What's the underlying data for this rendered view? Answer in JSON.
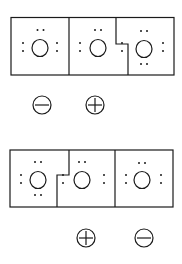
{
  "diagrams": [
    {
      "atoms": [
        {
          "symbol": "O",
          "lone_pairs": [
            "top",
            "left",
            "right"
          ]
        },
        {
          "symbol": "O",
          "lone_pairs": [
            "top",
            "left",
            "right"
          ]
        },
        {
          "symbol": "O",
          "lone_pairs": [
            "top",
            "left",
            "right",
            "bottom"
          ]
        }
      ],
      "charges": [
        {
          "label": "minus",
          "under_atom": 1
        },
        {
          "label": "plus",
          "under_atom": 2
        }
      ]
    },
    {
      "atoms": [
        {
          "symbol": "O",
          "lone_pairs": [
            "top",
            "left",
            "right",
            "bottom"
          ]
        },
        {
          "symbol": "O",
          "lone_pairs": [
            "top",
            "left",
            "right"
          ]
        },
        {
          "symbol": "O",
          "lone_pairs": [
            "top",
            "left",
            "right"
          ]
        }
      ],
      "charges": [
        {
          "label": "plus",
          "under_atom": 2
        },
        {
          "label": "minus",
          "under_atom": 3
        }
      ]
    }
  ],
  "colors": {
    "stroke": "#1a1a1a",
    "background": "#ffffff"
  }
}
